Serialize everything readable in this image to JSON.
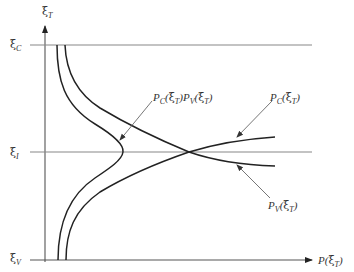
{
  "diagram": {
    "axes": {
      "y_label": {
        "main": "ξ",
        "sub": "T"
      },
      "x_label": {
        "prefix": "P(",
        "main": "ξ",
        "sub": "T",
        "suffix": ")"
      }
    },
    "levels": [
      {
        "id": "conduction",
        "main": "ξ",
        "sub": "C"
      },
      {
        "id": "intrinsic",
        "main": "ξ",
        "sub": "I"
      },
      {
        "id": "valence",
        "main": "ξ",
        "sub": "V"
      }
    ],
    "curves": [
      {
        "id": "pc",
        "label": {
          "p": "P",
          "psub": "C",
          "open": "(",
          "xi": "ξ",
          "xisub": "T",
          "close": ")"
        }
      },
      {
        "id": "pv",
        "label": {
          "p": "P",
          "psub": "V",
          "open": "(",
          "xi": "ξ",
          "xisub": "T",
          "close": ")"
        }
      },
      {
        "id": "product",
        "label": {
          "p1": "P",
          "p1sub": "C",
          "open1": "(",
          "xi1": "ξ",
          "xi1sub": "T",
          "close1": ")",
          "p2": "P",
          "p2sub": "V",
          "open2": "(",
          "xi2": "ξ",
          "xi2sub": "T",
          "close2": ")"
        }
      }
    ],
    "colors": {
      "line": "#222222",
      "axis": "#555555",
      "level": "#888888",
      "annotation": "#666666"
    }
  }
}
